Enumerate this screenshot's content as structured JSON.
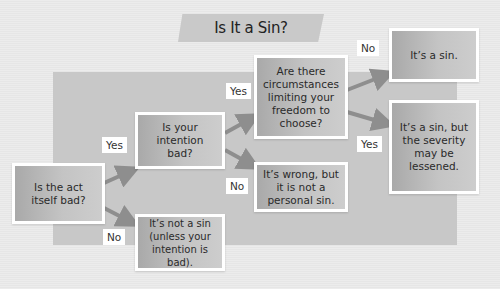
{
  "title": "Is It a Sin?",
  "nodes": {
    "act_bad": "Is the act\nitself bad?",
    "intention_bad": "Is your\nintention\nbad?",
    "not_sin": "It’s not a sin\n(unless your\nintention is bad).",
    "circumstances": "Are there\ncircumstances\nlimiting your\nfreedom to\nchoose?",
    "wrong_not_personal": "It’s wrong, but\nit is not a\npersonal sin.",
    "its_sin": "It’s a sin.",
    "sin_lessened": "It’s a sin, but\nthe severity\nmay be\nlessened."
  },
  "edge_labels": {
    "act_yes": "Yes",
    "act_no": "No",
    "intention_yes": "Yes",
    "intention_no": "No",
    "circ_no": "No",
    "circ_yes": "Yes"
  },
  "colors": {
    "background": "#e9e9e9",
    "panel": "#c8c8c8",
    "box": "#bdbdbd",
    "arrow": "#8e8e8e"
  }
}
